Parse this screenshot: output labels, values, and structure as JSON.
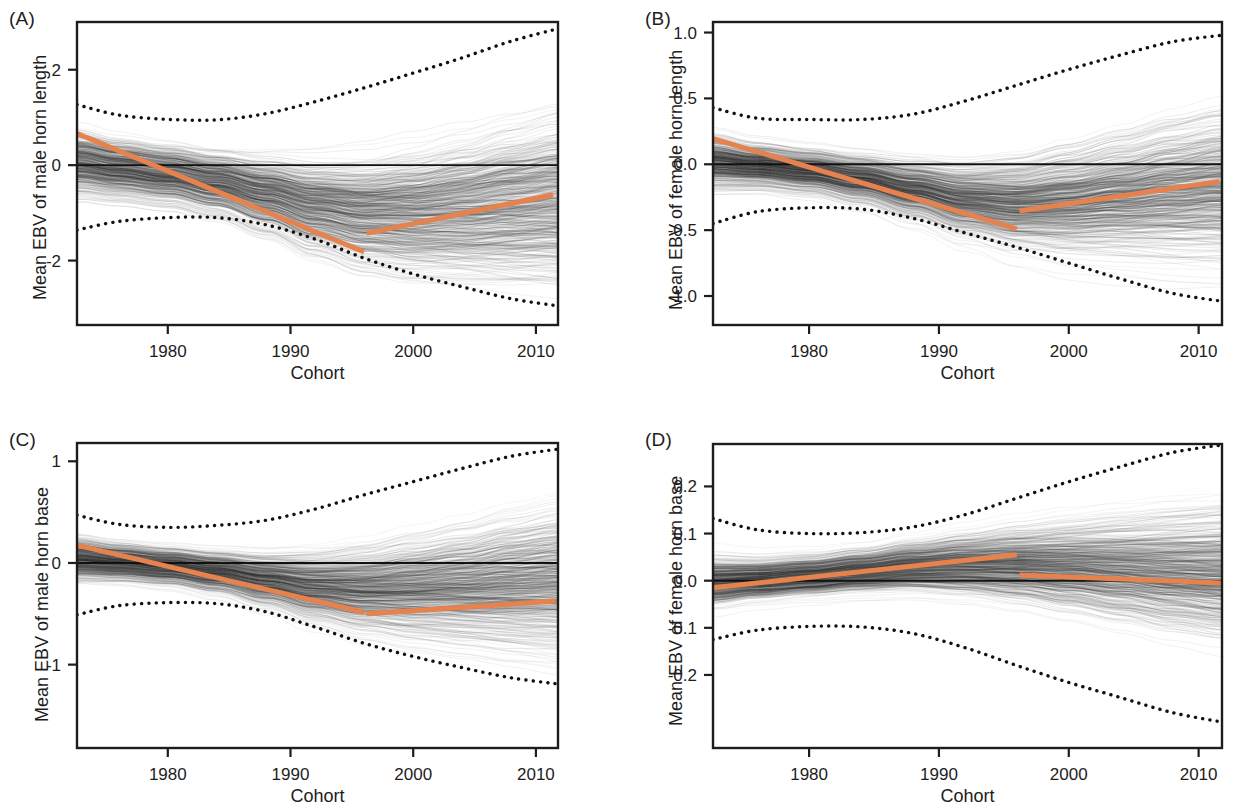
{
  "figure": {
    "background": "#ffffff",
    "trend_color": "#e5824e",
    "ci_color": "#111111",
    "spaghetti_color": "#2b2b2b",
    "width": 1233,
    "height": 804
  },
  "panels": [
    {
      "id": "A",
      "label": "(A)",
      "ylabel": "Mean EBV of male horn length",
      "xlabel": "Cohort",
      "box": {
        "left": 77,
        "top": 22,
        "right": 558,
        "bottom": 325
      },
      "label_pos": {
        "x": 9,
        "y": 8
      },
      "ylabel_pos": {
        "x": 30,
        "y": 300
      },
      "xlabel_pos": {
        "x": 77,
        "y": 363,
        "width": 481
      },
      "chart_data": {
        "type": "line",
        "title": "(A) Mean EBV of male horn length",
        "xlabel": "Cohort",
        "ylabel": "Mean EBV of male horn length",
        "xlim": [
          1972.6,
          2011.8
        ],
        "ylim": [
          -3.35,
          3.0
        ],
        "xticks": [
          1980,
          1990,
          2000,
          2010
        ],
        "xticklabels": [
          "1980",
          "1990",
          "2000",
          "2010"
        ],
        "yticks": [
          2,
          0,
          -2
        ],
        "yticklabels": [
          "2",
          "0",
          "-2"
        ],
        "grid": false,
        "legend": "none",
        "zero_line": 0,
        "series": [
          {
            "name": "upper 95% CI",
            "style": "dotted",
            "x": [
              1972.6,
              1976,
              1980,
              1984,
              1988,
              1992,
              1996,
              2000,
              2004,
              2008,
              2011.8
            ],
            "values": [
              1.27,
              1.05,
              0.96,
              0.95,
              1.08,
              1.33,
              1.62,
              1.93,
              2.25,
              2.6,
              2.86
            ]
          },
          {
            "name": "lower 95% CI",
            "style": "dotted",
            "x": [
              1972.6,
              1976,
              1980,
              1984,
              1988,
              1992,
              1996,
              2000,
              2004,
              2008,
              2011.8
            ],
            "values": [
              -1.36,
              -1.18,
              -1.1,
              -1.1,
              -1.25,
              -1.55,
              -1.95,
              -2.28,
              -2.55,
              -2.8,
              -2.95
            ]
          },
          {
            "name": "mean EBV trend (pre-1996)",
            "style": "solid",
            "color": "#e5824e",
            "x": [
              1972.6,
              1996.0
            ],
            "values": [
              0.66,
              -1.82
            ]
          },
          {
            "name": "mean EBV trend (post-1996)",
            "style": "solid",
            "color": "#e5824e",
            "x": [
              1996.2,
              2011.4
            ],
            "values": [
              -1.43,
              -0.62
            ]
          },
          {
            "name": "posterior spaghetti band (centre)",
            "style": "band",
            "x": [
              1972.6,
              1976,
              1980,
              1984,
              1988,
              1992,
              1996,
              2000,
              2004,
              2008,
              2011.8
            ],
            "values": [
              0.05,
              -0.08,
              -0.2,
              -0.38,
              -0.62,
              -0.88,
              -1.02,
              -1.02,
              -0.95,
              -0.86,
              -0.78
            ],
            "half_width": [
              1.0,
              0.95,
              0.95,
              1.02,
              1.22,
              1.48,
              1.72,
              1.92,
              2.08,
              2.22,
              2.3
            ]
          }
        ]
      }
    },
    {
      "id": "B",
      "label": "(B)",
      "ylabel": "Mean EBV of female horn length",
      "xlabel": "Cohort",
      "box": {
        "left": 713,
        "top": 22,
        "right": 1222,
        "bottom": 325
      },
      "label_pos": {
        "x": 645,
        "y": 8
      },
      "ylabel_pos": {
        "x": 666,
        "y": 310
      },
      "xlabel_pos": {
        "x": 713,
        "y": 363,
        "width": 509
      },
      "chart_data": {
        "type": "line",
        "title": "(B) Mean EBV of female horn length",
        "xlabel": "Cohort",
        "ylabel": "Mean EBV of female horn length",
        "xlim": [
          1972.6,
          2011.8
        ],
        "ylim": [
          -1.22,
          1.08
        ],
        "xticks": [
          1980,
          1990,
          2000,
          2010
        ],
        "xticklabels": [
          "1980",
          "1990",
          "2000",
          "2010"
        ],
        "yticks": [
          1.0,
          0.5,
          0.0,
          -0.5,
          -1.0
        ],
        "yticklabels": [
          "1.0",
          "0.5",
          "0.0",
          "-0.5",
          "-1.0"
        ],
        "grid": false,
        "legend": "none",
        "zero_line": 0,
        "series": [
          {
            "name": "upper 95% CI",
            "style": "dotted",
            "x": [
              1972.6,
              1976,
              1980,
              1984,
              1988,
              1992,
              1996,
              2000,
              2004,
              2008,
              2011.8
            ],
            "values": [
              0.43,
              0.35,
              0.34,
              0.34,
              0.38,
              0.48,
              0.6,
              0.72,
              0.83,
              0.93,
              0.98
            ]
          },
          {
            "name": "lower 95% CI",
            "style": "dotted",
            "x": [
              1972.6,
              1976,
              1980,
              1984,
              1988,
              1992,
              1996,
              2000,
              2004,
              2008,
              2011.8
            ],
            "values": [
              -0.45,
              -0.36,
              -0.33,
              -0.34,
              -0.41,
              -0.52,
              -0.63,
              -0.75,
              -0.87,
              -0.98,
              -1.04
            ]
          },
          {
            "name": "mean EBV trend (pre-1996)",
            "style": "solid",
            "color": "#e5824e",
            "x": [
              1972.6,
              1996.0
            ],
            "values": [
              0.195,
              -0.49
            ]
          },
          {
            "name": "mean EBV trend (post-1996)",
            "style": "solid",
            "color": "#e5824e",
            "x": [
              1996.2,
              2011.6
            ],
            "values": [
              -0.355,
              -0.13
            ]
          },
          {
            "name": "posterior spaghetti band (centre)",
            "style": "band",
            "x": [
              1972.6,
              1976,
              1980,
              1984,
              1988,
              1992,
              1996,
              2000,
              2004,
              2008,
              2011.8
            ],
            "values": [
              0.02,
              -0.01,
              -0.05,
              -0.11,
              -0.19,
              -0.27,
              -0.3,
              -0.28,
              -0.24,
              -0.2,
              -0.17
            ],
            "half_width": [
              0.29,
              0.25,
              0.25,
              0.28,
              0.34,
              0.42,
              0.5,
              0.58,
              0.64,
              0.7,
              0.73
            ]
          }
        ]
      }
    },
    {
      "id": "C",
      "label": "(C)",
      "ylabel": "Mean EBV of male horn base",
      "xlabel": "Cohort",
      "box": {
        "left": 77,
        "top": 443,
        "right": 558,
        "bottom": 748
      },
      "label_pos": {
        "x": 9,
        "y": 429
      },
      "ylabel_pos": {
        "x": 32,
        "y": 722
      },
      "xlabel_pos": {
        "x": 77,
        "y": 786,
        "width": 481
      },
      "chart_data": {
        "type": "line",
        "title": "(C) Mean EBV of male horn base",
        "xlabel": "Cohort",
        "ylabel": "Mean EBV of male horn base",
        "xlim": [
          1972.6,
          2011.8
        ],
        "ylim": [
          -1.82,
          1.18
        ],
        "xticks": [
          1980,
          1990,
          2000,
          2010
        ],
        "xticklabels": [
          "1980",
          "1990",
          "2000",
          "2010"
        ],
        "yticks": [
          1,
          0,
          -1
        ],
        "yticklabels": [
          "1",
          "0",
          "-1"
        ],
        "grid": false,
        "legend": "none",
        "zero_line": 0,
        "series": [
          {
            "name": "upper 95% CI",
            "style": "dotted",
            "x": [
              1972.6,
              1976,
              1980,
              1984,
              1988,
              1992,
              1996,
              2000,
              2004,
              2008,
              2011.8
            ],
            "values": [
              0.47,
              0.38,
              0.35,
              0.37,
              0.42,
              0.53,
              0.67,
              0.8,
              0.93,
              1.05,
              1.12
            ]
          },
          {
            "name": "lower 95% CI",
            "style": "dotted",
            "x": [
              1972.6,
              1976,
              1980,
              1984,
              1988,
              1992,
              1996,
              2000,
              2004,
              2008,
              2011.8
            ],
            "values": [
              -0.51,
              -0.42,
              -0.39,
              -0.4,
              -0.48,
              -0.63,
              -0.79,
              -0.92,
              -1.03,
              -1.13,
              -1.19
            ]
          },
          {
            "name": "mean EBV trend (pre-1996)",
            "style": "solid",
            "color": "#e5824e",
            "x": [
              1972.6,
              1996.0
            ],
            "values": [
              0.175,
              -0.485
            ]
          },
          {
            "name": "mean EBV trend (post-1996)",
            "style": "solid",
            "color": "#e5824e",
            "x": [
              1996.2,
              2011.6
            ],
            "values": [
              -0.5,
              -0.375
            ]
          },
          {
            "name": "posterior spaghetti band (centre)",
            "style": "band",
            "x": [
              1972.6,
              1976,
              1980,
              1984,
              1988,
              1992,
              1996,
              2000,
              2004,
              2008,
              2011.8
            ],
            "values": [
              0.03,
              0.0,
              -0.04,
              -0.1,
              -0.18,
              -0.25,
              -0.28,
              -0.27,
              -0.25,
              -0.22,
              -0.2
            ],
            "half_width": [
              0.3,
              0.27,
              0.27,
              0.3,
              0.37,
              0.48,
              0.58,
              0.67,
              0.74,
              0.82,
              0.87
            ]
          }
        ]
      }
    },
    {
      "id": "D",
      "label": "(D)",
      "ylabel": "Mean EBV of female horn base",
      "xlabel": "Cohort",
      "box": {
        "left": 713,
        "top": 444,
        "right": 1222,
        "bottom": 748
      },
      "label_pos": {
        "x": 645,
        "y": 429
      },
      "ylabel_pos": {
        "x": 666,
        "y": 726
      },
      "xlabel_pos": {
        "x": 713,
        "y": 786,
        "width": 509
      },
      "chart_data": {
        "type": "line",
        "title": "(D) Mean EBV of female horn base",
        "xlabel": "Cohort",
        "ylabel": "Mean EBV of female horn base",
        "xlim": [
          1972.6,
          2011.8
        ],
        "ylim": [
          -0.355,
          0.29
        ],
        "xticks": [
          1980,
          1990,
          2000,
          2010
        ],
        "xticklabels": [
          "1980",
          "1990",
          "2000",
          "2010"
        ],
        "yticks": [
          0.2,
          0.1,
          0.0,
          -0.1,
          -0.2
        ],
        "yticklabels": [
          "0.2",
          "0.1",
          "0.0",
          "-0.1",
          "-0.2"
        ],
        "grid": false,
        "legend": "none",
        "zero_line": 0,
        "series": [
          {
            "name": "upper 95% CI",
            "style": "dotted",
            "x": [
              1972.6,
              1976,
              1980,
              1984,
              1988,
              1992,
              1996,
              2000,
              2004,
              2008,
              2011.8
            ],
            "values": [
              0.132,
              0.108,
              0.1,
              0.102,
              0.114,
              0.14,
              0.175,
              0.21,
              0.242,
              0.272,
              0.288
            ]
          },
          {
            "name": "lower 95% CI",
            "style": "dotted",
            "x": [
              1972.6,
              1976,
              1980,
              1984,
              1988,
              1992,
              1996,
              2000,
              2004,
              2008,
              2011.8
            ],
            "values": [
              -0.125,
              -0.105,
              -0.097,
              -0.098,
              -0.112,
              -0.142,
              -0.18,
              -0.216,
              -0.248,
              -0.28,
              -0.3
            ]
          },
          {
            "name": "mean EBV trend (pre-1996)",
            "style": "solid",
            "color": "#e5824e",
            "x": [
              1972.6,
              1996.0
            ],
            "values": [
              -0.015,
              0.055
            ]
          },
          {
            "name": "mean EBV trend (post-1996)",
            "style": "solid",
            "color": "#e5824e",
            "x": [
              1996.2,
              2011.8
            ],
            "values": [
              0.012,
              -0.005
            ]
          },
          {
            "name": "posterior spaghetti band (centre)",
            "style": "band",
            "x": [
              1972.6,
              1976,
              1980,
              1984,
              1988,
              1992,
              1996,
              2000,
              2004,
              2008,
              2011.8
            ],
            "values": [
              -0.005,
              0.0,
              0.008,
              0.018,
              0.028,
              0.032,
              0.032,
              0.028,
              0.022,
              0.016,
              0.012
            ],
            "half_width": [
              0.078,
              0.068,
              0.068,
              0.072,
              0.082,
              0.098,
              0.115,
              0.132,
              0.148,
              0.163,
              0.172
            ]
          }
        ]
      }
    }
  ]
}
